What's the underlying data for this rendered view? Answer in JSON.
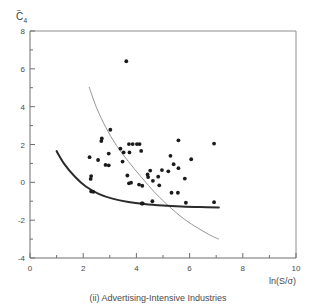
{
  "figure": {
    "caption": "(ii) Advertising-Intensive Industries",
    "ylabel_base": "C",
    "ylabel_tilde": "~",
    "ylabel_subscript": "4",
    "xlabel": "ln(S/σ)",
    "frame_color": "#8c8c8c",
    "point_color": "#1a1a1a",
    "curve_thick_color": "#2b2b2b",
    "curve_thin_color": "#8a8a8a",
    "background": "#ffffff"
  },
  "chart_data": {
    "type": "scatter",
    "title": "(ii) Advertising-Intensive Industries",
    "xlabel": "ln(S/σ)",
    "ylabel": "C̄4 (C-tilde sub 4)",
    "xlim": [
      0,
      10
    ],
    "ylim": [
      -4,
      8
    ],
    "xticks": [
      0,
      2,
      4,
      6,
      8,
      10
    ],
    "yticks": [
      -4,
      -2,
      0,
      2,
      4,
      6,
      8
    ],
    "xticklabels": [
      "0",
      "2",
      "4",
      "6",
      "8",
      "10"
    ],
    "yticklabels": [
      "-4",
      "-2",
      "0",
      "2",
      "4",
      "6",
      "8"
    ],
    "minor_ticks": true,
    "grid": false,
    "legend": "none",
    "points": [
      [
        3.62,
        6.4
      ],
      [
        3.02,
        2.78
      ],
      [
        2.7,
        2.32
      ],
      [
        2.68,
        2.18
      ],
      [
        3.72,
        2.02
      ],
      [
        3.86,
        2.02
      ],
      [
        4.02,
        2.02
      ],
      [
        4.12,
        2.02
      ],
      [
        5.58,
        2.22
      ],
      [
        6.92,
        2.05
      ],
      [
        3.4,
        1.78
      ],
      [
        2.96,
        1.52
      ],
      [
        3.52,
        1.58
      ],
      [
        3.74,
        1.58
      ],
      [
        4.18,
        1.66
      ],
      [
        2.24,
        1.33
      ],
      [
        2.56,
        1.18
      ],
      [
        5.28,
        1.4
      ],
      [
        6.06,
        1.22
      ],
      [
        2.84,
        0.92
      ],
      [
        2.96,
        0.9
      ],
      [
        3.48,
        1.1
      ],
      [
        5.4,
        0.96
      ],
      [
        5.58,
        0.75
      ],
      [
        4.52,
        0.62
      ],
      [
        4.96,
        0.65
      ],
      [
        5.2,
        0.58
      ],
      [
        2.3,
        0.33
      ],
      [
        2.28,
        0.18
      ],
      [
        3.66,
        0.36
      ],
      [
        4.42,
        0.42
      ],
      [
        4.44,
        0.28
      ],
      [
        4.82,
        0.3
      ],
      [
        4.62,
        0.08
      ],
      [
        5.82,
        0.2
      ],
      [
        3.72,
        -0.05
      ],
      [
        3.8,
        -0.02
      ],
      [
        4.1,
        -0.12
      ],
      [
        4.22,
        -0.18
      ],
      [
        4.86,
        -0.16
      ],
      [
        2.3,
        -0.48
      ],
      [
        2.38,
        -0.5
      ],
      [
        5.32,
        -0.55
      ],
      [
        5.56,
        -0.55
      ],
      [
        4.6,
        -1.0
      ],
      [
        5.86,
        -1.08
      ],
      [
        6.92,
        -1.05
      ],
      [
        4.2,
        -1.12
      ],
      [
        4.24,
        -1.12
      ]
    ],
    "curves": [
      {
        "name": "lower-bound-envelope-thick",
        "style": "solid-thick",
        "color": "#2b2b2b",
        "x": [
          1.0,
          1.3,
          1.7,
          2.1,
          2.6,
          3.1,
          3.7,
          4.3,
          5.0,
          5.7,
          6.4,
          7.1
        ],
        "y": [
          1.65,
          0.95,
          0.28,
          -0.22,
          -0.62,
          -0.86,
          -1.04,
          -1.15,
          -1.23,
          -1.28,
          -1.31,
          -1.33
        ]
      },
      {
        "name": "upper-bound-envelope-thin",
        "style": "solid-thin",
        "color": "#8a8a8a",
        "x": [
          2.22,
          2.5,
          2.85,
          3.25,
          3.7,
          4.2,
          4.7,
          5.25,
          5.8,
          6.35,
          6.85,
          7.1
        ],
        "y": [
          5.05,
          3.95,
          2.9,
          1.95,
          1.1,
          0.25,
          -0.55,
          -1.3,
          -1.95,
          -2.45,
          -2.85,
          -3.0
        ]
      }
    ]
  }
}
